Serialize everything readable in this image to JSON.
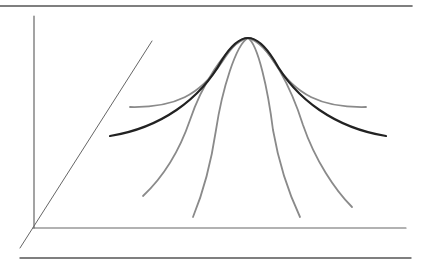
{
  "diagram": {
    "background": "#ffffff",
    "colors": {
      "frame": "#555555",
      "axis": "#666666",
      "main_curve": "#222222",
      "family_curve": "#8a8a8a"
    },
    "frame_lines": [
      {
        "name": "top-border-line",
        "x1": 0,
        "y1": 6,
        "x2": 412,
        "y2": 6,
        "width": 1.6
      },
      {
        "name": "bottom-border-line",
        "x1": 20,
        "y1": 258,
        "x2": 411,
        "y2": 258,
        "width": 1.4
      }
    ],
    "axes": [
      {
        "name": "vertical-axis",
        "x1": 34,
        "y1": 16,
        "x2": 34,
        "y2": 228,
        "width": 1.2
      },
      {
        "name": "horizontal-axis",
        "x1": 33,
        "y1": 228,
        "x2": 406,
        "y2": 228,
        "width": 1.2
      },
      {
        "name": "depth-axis",
        "x1": 152,
        "y1": 41,
        "x2": 20,
        "y2": 248,
        "width": 1.0
      }
    ],
    "main_curve": {
      "name": "main-bell-curve",
      "d": "M110,136 C160,128 200,100 222,60 C232,44 240,38 248,38 C256,38 264,44 274,60 C296,100 336,128 386,136",
      "width": 2.2
    },
    "family_curves": [
      {
        "name": "flat-bell-curve",
        "d": "M130,107 C175,108 200,95 222,62 C232,46 240,38 248,38 C256,38 264,46 274,62 C296,95 321,108 366,107",
        "width": 1.8
      },
      {
        "name": "steep-curve-far-left",
        "d": "M248,38 C225,44 200,90 190,120 C178,155 160,180 143,196",
        "width": 1.8
      },
      {
        "name": "steep-curve-left",
        "d": "M248,38 C236,44 222,90 216,130 C210,170 200,200 193,217",
        "width": 1.8
      },
      {
        "name": "steep-curve-right",
        "d": "M248,38 C258,44 268,90 273,130 C280,170 292,200 300,217",
        "width": 1.8
      },
      {
        "name": "steep-curve-far-right",
        "d": "M248,38 C270,44 292,90 303,125 C315,160 335,190 352,207",
        "width": 1.8
      }
    ]
  }
}
